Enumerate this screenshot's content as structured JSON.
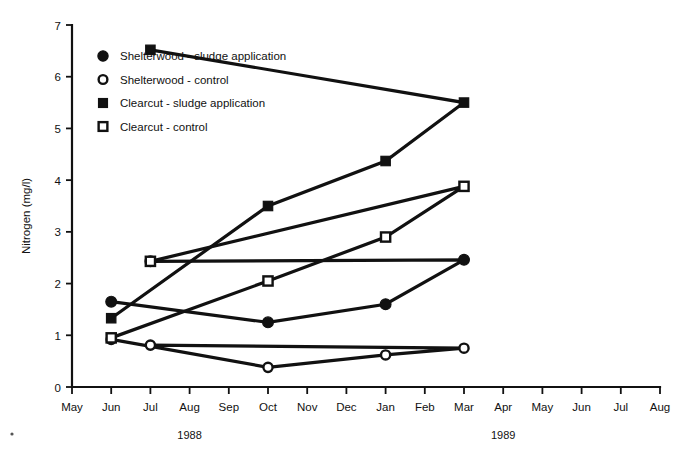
{
  "chart_data": {
    "type": "line",
    "title": "",
    "xlabel": "",
    "ylabel": "Nitrogen (mg/l)",
    "ylim": [
      0,
      7
    ],
    "yticks": [
      0,
      1,
      2,
      3,
      4,
      5,
      6,
      7
    ],
    "ytick_labels": [
      "0",
      "1",
      "2",
      "3",
      "4",
      "5",
      "6",
      "7"
    ],
    "categories": [
      "May",
      "Jun",
      "Jul",
      "Aug",
      "Sep",
      "Oct",
      "Nov",
      "Dec",
      "Jan",
      "Feb",
      "Mar",
      "Apr",
      "May",
      "Jun",
      "Jul",
      "Aug"
    ],
    "x_group_labels": [
      {
        "label": "1988",
        "center_category": "Aug"
      },
      {
        "label": "1989",
        "center_category": "Apr"
      }
    ],
    "grid": false,
    "legend_position": "upper-left-inside",
    "series": [
      {
        "name": "Shelterwood - sludge application",
        "marker": "filled-circle",
        "x": [
          "Jun",
          "Oct",
          "Jan",
          "Mar",
          "Jul"
        ],
        "values": [
          1.65,
          1.25,
          1.6,
          2.46,
          2.43
        ]
      },
      {
        "name": "Shelterwood - control",
        "marker": "open-circle",
        "x": [
          "Jun",
          "Oct",
          "Jan",
          "Mar",
          "Jul"
        ],
        "values": [
          0.92,
          0.38,
          0.62,
          0.75,
          0.81
        ]
      },
      {
        "name": "Clearcut - sludge application",
        "marker": "filled-square",
        "x": [
          "Jun",
          "Oct",
          "Jan",
          "Mar",
          "Jul"
        ],
        "values": [
          1.33,
          3.5,
          4.37,
          5.5,
          6.52
        ]
      },
      {
        "name": "Clearcut - control",
        "marker": "open-square",
        "x": [
          "Jun",
          "Oct",
          "Jan",
          "Mar",
          "Jul"
        ],
        "values": [
          0.95,
          2.05,
          2.9,
          3.88,
          2.43
        ]
      }
    ]
  },
  "legend": {
    "entries": [
      {
        "label": "Shelterwood - sludge application",
        "marker": "filled-circle"
      },
      {
        "label": "Shelterwood - control",
        "marker": "open-circle"
      },
      {
        "label": "Clearcut - sludge application",
        "marker": "filled-square"
      },
      {
        "label": "Clearcut - control",
        "marker": "open-square"
      }
    ]
  },
  "colors": {
    "ink": "#111111",
    "background": "#ffffff"
  }
}
